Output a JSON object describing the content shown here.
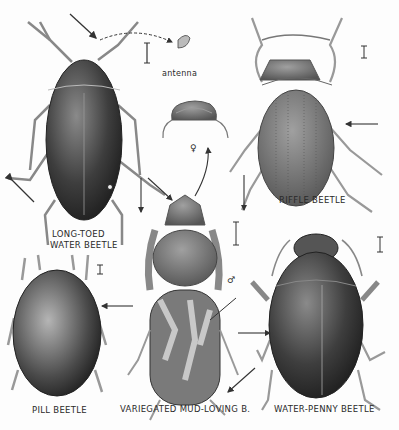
{
  "plate": {
    "labels": {
      "antenna": "antenna",
      "long_toed_line1": "LONG-TOED",
      "long_toed_line2": "WATER BEETLE",
      "riffle": "RIFFLE BEETLE",
      "pill": "PILL BEETLE",
      "variegated": "VARIEGATED MUD-LOVING B.",
      "water_penny": "WATER-PENNY BEETLE",
      "female_symbol": "♀",
      "male_symbol": "♂"
    },
    "colors": {
      "ink": "#2a2a2a",
      "body_dark": "#3a3a3a",
      "body_mid": "#6a6a6a",
      "legs": "#9a9a9a",
      "background": "#fdfdfd"
    }
  }
}
